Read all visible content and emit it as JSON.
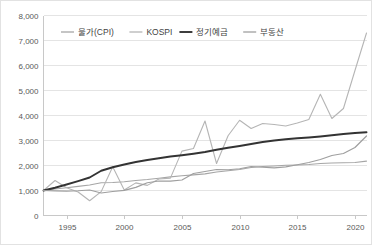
{
  "chart_data": {
    "type": "line",
    "title": "",
    "subtitle": "",
    "xlabel": "",
    "ylabel": "",
    "xlim": [
      1993,
      2021
    ],
    "ylim": [
      0,
      8000
    ],
    "grid": true,
    "legend_position": "top-left-inside",
    "y_ticks": [
      "0",
      "1,000",
      "2,000",
      "3,000",
      "4,000",
      "5,000",
      "6,000",
      "7,000",
      "8,000"
    ],
    "y_tick_values": [
      0,
      1000,
      2000,
      3000,
      4000,
      5000,
      6000,
      7000,
      8000
    ],
    "x_ticks": [
      "1995",
      "2000",
      "2005",
      "2010",
      "2015",
      "2020"
    ],
    "x_tick_values": [
      1995,
      2000,
      2005,
      2010,
      2015,
      2020
    ],
    "x": [
      1993,
      1994,
      1995,
      1996,
      1997,
      1998,
      1999,
      2000,
      2001,
      2002,
      2003,
      2004,
      2005,
      2006,
      2007,
      2008,
      2009,
      2010,
      2011,
      2012,
      2013,
      2014,
      2015,
      2016,
      2017,
      2018,
      2019,
      2020,
      2021
    ],
    "series": [
      {
        "name": "물가(CPI)",
        "color": "#a6a6a6",
        "width": 1.1,
        "values": [
          1000,
          1062,
          1110,
          1165,
          1217,
          1307,
          1318,
          1348,
          1403,
          1442,
          1493,
          1546,
          1588,
          1624,
          1665,
          1743,
          1791,
          1843,
          1917,
          1958,
          1983,
          2008,
          2022,
          2042,
          2082,
          2103,
          2111,
          2122,
          2175
        ]
      },
      {
        "name": "KOSPI",
        "color": "#b5b5b5",
        "width": 1.1,
        "values": [
          1000,
          1400,
          1108,
          942,
          589,
          955,
          1950,
          1020,
          1305,
          1205,
          1462,
          1495,
          2575,
          2680,
          3780,
          2080,
          3190,
          3810,
          3480,
          3680,
          3640,
          3580,
          3700,
          3840,
          4850,
          3880,
          4280,
          5800,
          7300
        ]
      },
      {
        "name": "정기예금",
        "color": "#333333",
        "width": 1.9,
        "values": [
          1000,
          1110,
          1240,
          1375,
          1520,
          1790,
          1930,
          2040,
          2140,
          2220,
          2290,
          2360,
          2410,
          2470,
          2540,
          2630,
          2710,
          2780,
          2860,
          2940,
          3000,
          3050,
          3090,
          3120,
          3160,
          3210,
          3260,
          3300,
          3330
        ]
      },
      {
        "name": "부동산",
        "color": "#9f9f9f",
        "width": 1.2,
        "values": [
          1000,
          983,
          972,
          990,
          1020,
          900,
          960,
          1005,
          1125,
          1310,
          1380,
          1375,
          1420,
          1680,
          1760,
          1840,
          1830,
          1870,
          1960,
          1930,
          1905,
          1945,
          2030,
          2120,
          2240,
          2400,
          2480,
          2720,
          3180
        ]
      }
    ]
  },
  "legend": {
    "items": [
      {
        "label": "물가(CPI)"
      },
      {
        "label": "KOSPI"
      },
      {
        "label": "정기예금"
      },
      {
        "label": "부동산"
      }
    ]
  }
}
